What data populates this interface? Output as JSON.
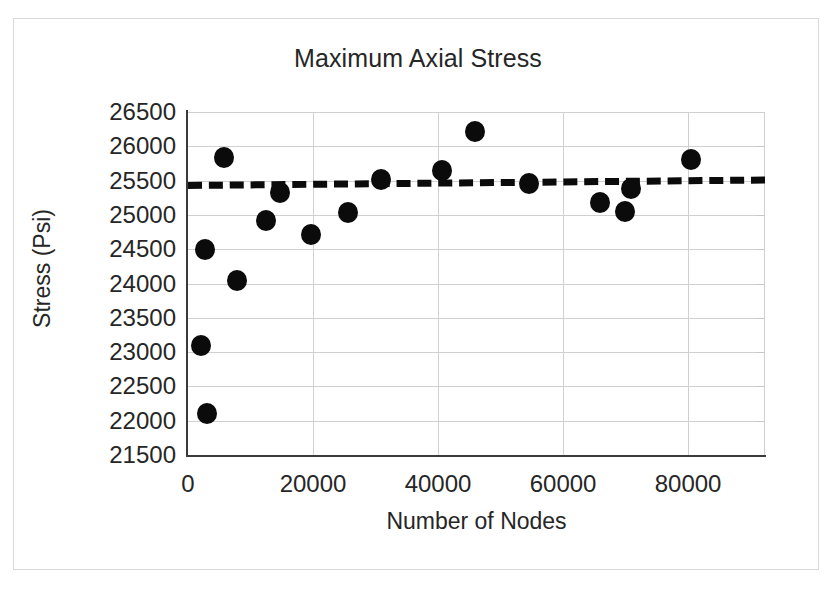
{
  "chart_data": {
    "type": "scatter",
    "title": "Maximum Axial Stress",
    "xlabel": "Number of Nodes",
    "ylabel": "Stress (Psi)",
    "xlim": [
      0,
      92300
    ],
    "ylim": [
      21500,
      26500
    ],
    "xticks": [
      0,
      20000,
      40000,
      60000,
      80000
    ],
    "xtick_labels": [
      "0",
      "20000",
      "40000",
      "60000",
      "80000"
    ],
    "yticks": [
      21500,
      22000,
      22500,
      23000,
      23500,
      24000,
      24500,
      25000,
      25500,
      26000,
      26500
    ],
    "ytick_labels": [
      "21500",
      "22000",
      "22500",
      "23000",
      "23500",
      "24000",
      "24500",
      "25000",
      "25500",
      "26000",
      "26500"
    ],
    "grid": "both",
    "legend": "none",
    "marker": "filled-circle",
    "marker_color": "#0b0b0b",
    "series": [
      {
        "name": "Maximum Axial Stress",
        "points": [
          {
            "x": 2000,
            "y": 23100
          },
          {
            "x": 2700,
            "y": 24500
          },
          {
            "x": 3100,
            "y": 22100
          },
          {
            "x": 5800,
            "y": 25830
          },
          {
            "x": 7900,
            "y": 24050
          },
          {
            "x": 12400,
            "y": 24920
          },
          {
            "x": 14700,
            "y": 25330
          },
          {
            "x": 19700,
            "y": 24720
          },
          {
            "x": 25600,
            "y": 25040
          },
          {
            "x": 30800,
            "y": 25520
          },
          {
            "x": 40600,
            "y": 25640
          },
          {
            "x": 45900,
            "y": 26210
          },
          {
            "x": 54600,
            "y": 25460
          },
          {
            "x": 65900,
            "y": 25180
          },
          {
            "x": 69900,
            "y": 25050
          },
          {
            "x": 70900,
            "y": 25380
          },
          {
            "x": 80500,
            "y": 25810
          }
        ]
      }
    ],
    "trendline": {
      "style": "dashed",
      "color": "#0b0b0b",
      "x_start": 0,
      "y_start": 25480,
      "x_end": 92300,
      "y_end": 25560
    }
  }
}
